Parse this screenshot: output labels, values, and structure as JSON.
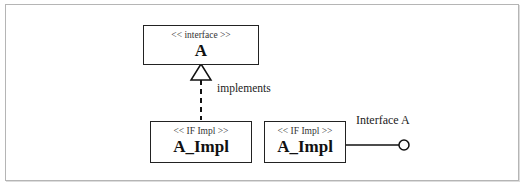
{
  "diagram": {
    "interface_box": {
      "stereotype": "<< interface >>",
      "name": "A"
    },
    "impl_box_left": {
      "stereotype": "<< IF Impl >>",
      "name": "A_Impl"
    },
    "impl_box_right": {
      "stereotype": "<< IF Impl >>",
      "name": "A_Impl"
    },
    "realization_label": "implements",
    "lollipop_label": "Interface A"
  }
}
